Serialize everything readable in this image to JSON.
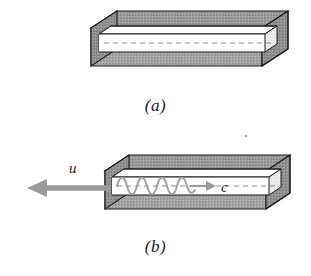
{
  "figure": {
    "type": "physics-diagram",
    "background_color": "#ffffff",
    "panels": [
      {
        "id": "a",
        "caption": "(a)",
        "description": "stationary rectangular hollow waveguide shown in oblique projection with dashed axial centerline",
        "has_wave": false,
        "has_velocity_arrow": false
      },
      {
        "id": "b",
        "caption": "(b)",
        "description": "same waveguide moving to the left with speed u while a wave travels to the right at speed c",
        "has_wave": true,
        "has_velocity_arrow": true
      }
    ],
    "labels": {
      "velocity_symbol": "u",
      "light_speed_symbol": "c"
    },
    "colors": {
      "outline": "#1a1a1a",
      "top_face": "#9a9a9a",
      "front_face": "#a2a2a2",
      "end_face": "#8f8f8f",
      "inner_face": "#f4f4f4",
      "cavity_white": "#ffffff",
      "arrow_gray": "#9b9b9b",
      "wave_gray": "#a0a0a0",
      "dashed_line": "#8a8a8a",
      "text": "#1a1a1a"
    },
    "wave": {
      "cycles": 4,
      "amplitude_px": 7,
      "direction": "rightward"
    }
  }
}
